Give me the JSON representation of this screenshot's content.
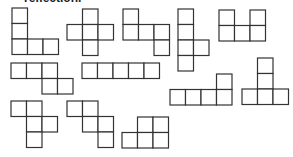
{
  "header": {
    "text": "reflection."
  },
  "style": {
    "stroke_color": "#333333",
    "fill_color": "#ffffff",
    "cell_size": 15.5
  },
  "shapes": [
    {
      "id": "net-1",
      "x": 12,
      "y": 8,
      "cells": [
        [
          0,
          0
        ],
        [
          0,
          1
        ],
        [
          0,
          2
        ],
        [
          1,
          2
        ],
        [
          2,
          2
        ]
      ]
    },
    {
      "id": "net-2",
      "x": 67,
      "y": 9,
      "cells": [
        [
          1,
          0
        ],
        [
          0,
          1
        ],
        [
          1,
          1
        ],
        [
          2,
          1
        ],
        [
          1,
          2
        ]
      ]
    },
    {
      "id": "net-3",
      "x": 123,
      "y": 9,
      "cells": [
        [
          0,
          0
        ],
        [
          0,
          1
        ],
        [
          1,
          1
        ],
        [
          2,
          1
        ],
        [
          2,
          2
        ]
      ]
    },
    {
      "id": "net-4",
      "x": 178,
      "y": 9,
      "cells": [
        [
          0,
          0
        ],
        [
          0,
          1
        ],
        [
          0,
          2
        ],
        [
          1,
          2
        ],
        [
          0,
          3
        ]
      ]
    },
    {
      "id": "net-5",
      "x": 219,
      "y": 10,
      "cells": [
        [
          0,
          0
        ],
        [
          2,
          0
        ],
        [
          0,
          1
        ],
        [
          1,
          1
        ],
        [
          2,
          1
        ]
      ]
    },
    {
      "id": "net-6",
      "x": 11,
      "y": 63,
      "cells": [
        [
          0,
          0
        ],
        [
          1,
          0
        ],
        [
          2,
          0
        ],
        [
          2,
          1
        ],
        [
          3,
          1
        ]
      ]
    },
    {
      "id": "net-7",
      "x": 82,
      "y": 63,
      "cells": [
        [
          0,
          0
        ],
        [
          1,
          0
        ],
        [
          2,
          0
        ],
        [
          3,
          0
        ],
        [
          4,
          0
        ]
      ]
    },
    {
      "id": "net-8",
      "x": 170,
      "y": 74,
      "cells": [
        [
          3,
          0
        ],
        [
          0,
          1
        ],
        [
          1,
          1
        ],
        [
          2,
          1
        ],
        [
          3,
          1
        ]
      ]
    },
    {
      "id": "net-9",
      "x": 242,
      "y": 58,
      "cells": [
        [
          1,
          0
        ],
        [
          1,
          1
        ],
        [
          0,
          2
        ],
        [
          1,
          2
        ],
        [
          2,
          2
        ]
      ]
    },
    {
      "id": "net-10",
      "x": 11,
      "y": 101,
      "cells": [
        [
          0,
          0
        ],
        [
          1,
          0
        ],
        [
          1,
          1
        ],
        [
          2,
          1
        ],
        [
          1,
          2
        ]
      ]
    },
    {
      "id": "net-11",
      "x": 67,
      "y": 101,
      "cells": [
        [
          0,
          0
        ],
        [
          1,
          0
        ],
        [
          1,
          1
        ],
        [
          2,
          1
        ],
        [
          2,
          2
        ]
      ]
    },
    {
      "id": "net-12",
      "x": 122,
      "y": 117,
      "cells": [
        [
          1,
          0
        ],
        [
          2,
          0
        ],
        [
          0,
          1
        ],
        [
          1,
          1
        ],
        [
          2,
          1
        ]
      ]
    }
  ]
}
